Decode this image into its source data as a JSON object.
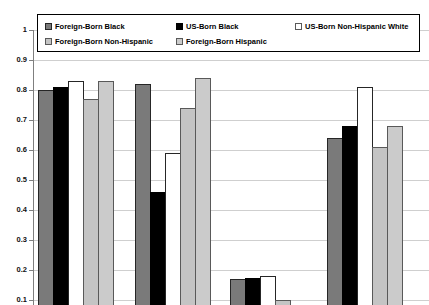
{
  "page": {
    "background": "#ffffff"
  },
  "legend": {
    "position": "top",
    "items": [
      {
        "label": "Foreign-Born Black",
        "color": "#7a7a7a",
        "border": "#262626"
      },
      {
        "label": "US-Born Black",
        "color": "#000000",
        "border": "#000000"
      },
      {
        "label": "US-Born Non-Hispanic White",
        "color": "#ffffff",
        "border": "#595959"
      },
      {
        "label": "Foreign-Born Non-Hispanic",
        "color": "#c4c4c4",
        "border": "#595959"
      },
      {
        "label": "Foreign-Born Hispanic",
        "color": "#cbcbcb",
        "border": "#595959"
      }
    ]
  },
  "chart_data": {
    "type": "bar",
    "title": "",
    "xlabel": "",
    "ylabel": "",
    "categories": [
      "",
      "",
      "",
      ""
    ],
    "x_axis_labels_visible": false,
    "bottom_clipped_at_value": 0.08,
    "grid": true,
    "legend_position": "top",
    "ylim": [
      0.1,
      1.0
    ],
    "yticks": [
      "1",
      "0.9",
      "0.8",
      "0.7",
      "0.6",
      "0.5",
      "0.4",
      "0.3",
      "0.2",
      "0.1"
    ],
    "series": [
      {
        "name": "Foreign-Born Black",
        "color": "#7a7a7a",
        "border": "#262626",
        "values": [
          0.8,
          0.82,
          0.17,
          0.64
        ]
      },
      {
        "name": "US-Born Black",
        "color": "#000000",
        "border": "#000000",
        "values": [
          0.81,
          0.46,
          0.175,
          0.68
        ]
      },
      {
        "name": "US-Born Non-Hispanic White",
        "color": "#ffffff",
        "border": "#262626",
        "values": [
          0.83,
          0.59,
          0.18,
          0.81
        ]
      },
      {
        "name": "Foreign-Born Non-Hispanic",
        "color": "#c4c4c4",
        "border": "#595959",
        "values": [
          0.77,
          0.74,
          0.1,
          0.61
        ]
      },
      {
        "name": "Foreign-Born Hispanic",
        "color": "#cbcbcb",
        "border": "#595959",
        "values": [
          0.83,
          0.84,
          0.07,
          0.68
        ]
      }
    ]
  }
}
